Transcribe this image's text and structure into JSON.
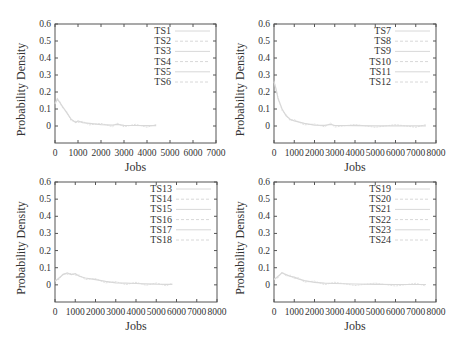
{
  "figure": {
    "layout": "2x2 grid",
    "panel_ids": [
      "top-left",
      "top-right",
      "bottom-left",
      "bottom-right"
    ]
  },
  "colors": {
    "axis": "#555555",
    "curve": "#d8d8d8",
    "grid_ticks": "#555555",
    "text": "#333333"
  },
  "chart_data": [
    {
      "type": "line",
      "title": "",
      "xlabel": "Jobs",
      "ylabel": "Probability Density",
      "xlim": [
        0,
        7000
      ],
      "ylim": [
        -0.1,
        0.6
      ],
      "xticks": [
        "0",
        "1000",
        "2000",
        "3000",
        "4000",
        "5000",
        "6000",
        "7000"
      ],
      "yticks": [
        "0",
        "0.1",
        "0.2",
        "0.3",
        "0.4",
        "0.5",
        "0.6"
      ],
      "grid": false,
      "legend_position": "top-right inside",
      "legend": [
        "TS1",
        "TS2",
        "TS3",
        "TS4",
        "TS5",
        "TS6"
      ],
      "series": [
        {
          "name": "TS1-TS6 (overlaid, faint)",
          "x": [
            0,
            100,
            200,
            300,
            500,
            700,
            900,
            1000,
            1200,
            1500,
            2000,
            2500,
            2700,
            3000,
            3500,
            4000,
            4400
          ],
          "values": [
            0.13,
            0.16,
            0.14,
            0.12,
            0.08,
            0.04,
            0.02,
            0.03,
            0.02,
            0.015,
            0.008,
            0.005,
            0.01,
            0.004,
            0.003,
            0.002,
            0.002
          ]
        }
      ]
    },
    {
      "type": "line",
      "title": "",
      "xlabel": "Jobs",
      "ylabel": "Probability Density",
      "xlim": [
        0,
        8000
      ],
      "ylim": [
        -0.1,
        0.6
      ],
      "xticks": [
        "0",
        "1000",
        "2000",
        "3000",
        "4000",
        "5000",
        "6000",
        "7000",
        "8000"
      ],
      "yticks": [
        "0",
        "0.1",
        "0.2",
        "0.3",
        "0.4",
        "0.5",
        "0.6"
      ],
      "grid": false,
      "legend_position": "top-right inside",
      "legend": [
        "TS7",
        "TS8",
        "TS9",
        "TS10",
        "TS11",
        "TS12"
      ],
      "series": [
        {
          "name": "TS7-TS12 (overlaid, faint)",
          "x": [
            0,
            100,
            200,
            400,
            600,
            800,
            1000,
            1500,
            2000,
            2500,
            2800,
            3000,
            4000,
            5000,
            6000,
            7000,
            7500
          ],
          "values": [
            0.26,
            0.22,
            0.16,
            0.1,
            0.06,
            0.04,
            0.03,
            0.015,
            0.005,
            0.004,
            0.01,
            0.003,
            0.002,
            0.001,
            0.001,
            0.001,
            0.001
          ]
        }
      ]
    },
    {
      "type": "line",
      "title": "",
      "xlabel": "Jobs",
      "ylabel": "Probability Density",
      "xlim": [
        0,
        8000
      ],
      "ylim": [
        -0.1,
        0.6
      ],
      "xticks": [
        "0",
        "1000",
        "2000",
        "3000",
        "4000",
        "5000",
        "6000",
        "7000",
        "8000"
      ],
      "yticks": [
        "0",
        "0.1",
        "0.2",
        "0.3",
        "0.4",
        "0.5",
        "0.6"
      ],
      "grid": false,
      "legend_position": "top-right inside",
      "legend": [
        "TS13",
        "TS14",
        "TS15",
        "TS16",
        "TS17",
        "TS18"
      ],
      "series": [
        {
          "name": "TS13-TS18 (overlaid, faint)",
          "x": [
            0,
            200,
            400,
            600,
            800,
            1000,
            1200,
            1500,
            2000,
            2500,
            3000,
            3500,
            4000,
            4500,
            5000,
            5500,
            5800
          ],
          "values": [
            0.02,
            0.04,
            0.06,
            0.07,
            0.06,
            0.065,
            0.05,
            0.04,
            0.03,
            0.02,
            0.012,
            0.01,
            0.008,
            0.006,
            0.004,
            0.003,
            0.003
          ]
        }
      ]
    },
    {
      "type": "line",
      "title": "",
      "xlabel": "Jobs",
      "ylabel": "Probability Density",
      "xlim": [
        0,
        8000
      ],
      "ylim": [
        -0.1,
        0.6
      ],
      "xticks": [
        "0",
        "1000",
        "2000",
        "3000",
        "4000",
        "5000",
        "6000",
        "7000",
        "8000"
      ],
      "yticks": [
        "0",
        "0.1",
        "0.2",
        "0.3",
        "0.4",
        "0.5",
        "0.6"
      ],
      "grid": false,
      "legend_position": "top-right inside",
      "legend": [
        "TS19",
        "TS20",
        "TS21",
        "TS22",
        "TS23",
        "TS24"
      ],
      "series": [
        {
          "name": "TS19-TS24 (overlaid, faint)",
          "x": [
            0,
            200,
            400,
            600,
            800,
            1000,
            1200,
            1500,
            2000,
            2500,
            3000,
            4000,
            5000,
            6000,
            7000,
            7500
          ],
          "values": [
            0.03,
            0.05,
            0.07,
            0.06,
            0.05,
            0.045,
            0.035,
            0.025,
            0.015,
            0.01,
            0.008,
            0.005,
            0.003,
            0.002,
            0.002,
            0.002
          ]
        }
      ]
    }
  ]
}
